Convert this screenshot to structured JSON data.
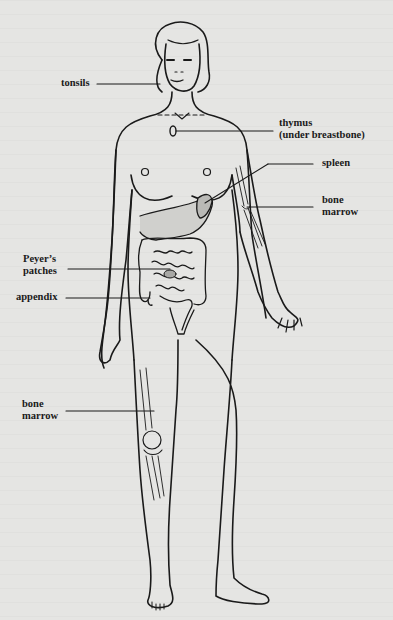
{
  "diagram": {
    "colors": {
      "background": "#e5e5e3",
      "ink": "#1a1a1a",
      "spleen_fill": "#b9b9b6"
    },
    "labels": {
      "tonsils": {
        "text": "tonsils"
      },
      "thymus": {
        "line1": "thymus",
        "line2": "(under breastbone)"
      },
      "spleen": {
        "text": "spleen"
      },
      "bone_marrow_arm": {
        "line1": "bone",
        "line2": "marrow"
      },
      "peyers_patches": {
        "line1": "Peyer’s",
        "line2": "patches"
      },
      "appendix": {
        "text": "appendix"
      },
      "bone_marrow_leg": {
        "line1": "bone",
        "line2": "marrow"
      }
    }
  }
}
